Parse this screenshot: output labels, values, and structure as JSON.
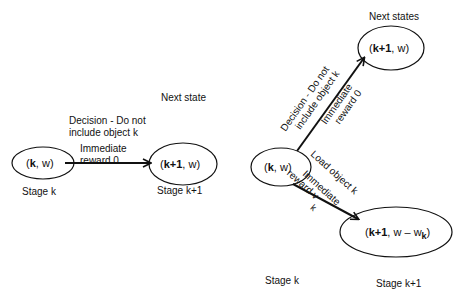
{
  "left_diagram": {
    "source_node": {
      "k": "k",
      "w": "w",
      "label": "( k, w )"
    },
    "target_node": {
      "k": "k+1",
      "w": "w",
      "label": "( k+1, w )"
    },
    "next_state_label": "Next state",
    "edge": {
      "decision_line1": "Decision - Do not",
      "decision_line2": "include object  k",
      "reward_line1": "Immediate",
      "reward_line2": "reward  0"
    },
    "stage_left": "Stage  k",
    "stage_right": "Stage  k+1"
  },
  "right_diagram": {
    "source_node": {
      "k": "k",
      "w": "w",
      "label": "( k, w )"
    },
    "upper_target": {
      "k": "k+1",
      "w": "w",
      "label": "( k+1, w )"
    },
    "lower_target": {
      "k": "k+1",
      "w": "w – w",
      "subscript": "k",
      "label": "( k+1, w – w_k )"
    },
    "next_states_label": "Next states",
    "upper_edge": {
      "decision_line1": "Decision - Do not",
      "decision_line2": "include object  k",
      "reward_line1": "Immediate",
      "reward_line2": "reward  0"
    },
    "lower_edge": {
      "decision": "Load object  k",
      "reward_line1": "Immediate",
      "reward_line2": "reward  v",
      "reward_subscript": "k"
    },
    "stage_left": "Stage  k",
    "stage_right": "Stage  k+1"
  }
}
